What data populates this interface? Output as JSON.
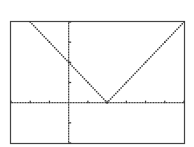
{
  "chart_data": {
    "type": "line",
    "title": "",
    "xlabel": "",
    "ylabel": "",
    "function": "y = |x - 2|",
    "window": {
      "xmin": -3,
      "xmax": 6,
      "ymin": -2,
      "ymax": 4,
      "xscl": 1,
      "yscl": 1
    },
    "xlim": [
      -3,
      6
    ],
    "ylim": [
      -2,
      4
    ],
    "grid": false,
    "legend": null,
    "style": "dotted",
    "series": [
      {
        "name": "Y1",
        "x": [
          -2,
          -1,
          0,
          1,
          2,
          3,
          4,
          5,
          6
        ],
        "values": [
          4,
          3,
          2,
          1,
          0,
          1,
          2,
          3,
          4
        ]
      }
    ],
    "vertex": {
      "x": 2,
      "y": 0
    },
    "y_intercept": 2,
    "colors": {
      "background": "#ffffff",
      "ink": "#333333"
    }
  },
  "screen": {
    "label": "Graphing calculator graph screen"
  }
}
